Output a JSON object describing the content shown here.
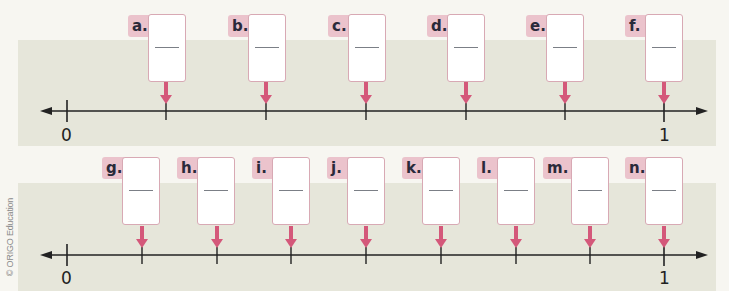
{
  "copyright": "© ORIGO Education",
  "colors": {
    "band": "#e6e6da",
    "background": "#f7f6f1",
    "arrow": "#d4587a",
    "tag": "#ebc3cc",
    "line": "#222222"
  },
  "number_lines": [
    {
      "start_label": "0",
      "end_label": "1",
      "divisions": 6,
      "items": [
        {
          "label": "a.",
          "answer": ""
        },
        {
          "label": "b.",
          "answer": ""
        },
        {
          "label": "c.",
          "answer": ""
        },
        {
          "label": "d.",
          "answer": ""
        },
        {
          "label": "e.",
          "answer": ""
        },
        {
          "label": "f.",
          "answer": ""
        }
      ]
    },
    {
      "start_label": "0",
      "end_label": "1",
      "divisions": 8,
      "items": [
        {
          "label": "g.",
          "answer": ""
        },
        {
          "label": "h.",
          "answer": ""
        },
        {
          "label": "i.",
          "answer": ""
        },
        {
          "label": "j.",
          "answer": ""
        },
        {
          "label": "k.",
          "answer": ""
        },
        {
          "label": "l.",
          "answer": ""
        },
        {
          "label": "m.",
          "answer": ""
        },
        {
          "label": "n.",
          "answer": ""
        }
      ]
    }
  ]
}
